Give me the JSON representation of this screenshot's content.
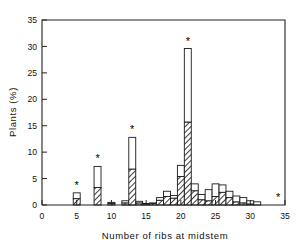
{
  "chart_data": {
    "type": "bar",
    "title": "",
    "subtitle": "",
    "xlabel": "Number of ribs at midstem",
    "ylabel": "Plants (%)",
    "xlim": [
      0,
      35
    ],
    "ylim": [
      0,
      35
    ],
    "xticks": [
      0,
      5,
      10,
      15,
      20,
      25,
      30,
      35
    ],
    "xticklabels": [
      "0",
      "5",
      "10",
      "15",
      "20",
      "25",
      "30",
      "35"
    ],
    "yticks": [
      0,
      5,
      10,
      15,
      20,
      25,
      30,
      35
    ],
    "yticklabels": [
      "0",
      "5",
      "10",
      "15",
      "20",
      "25",
      "30",
      "35"
    ],
    "grid": false,
    "legend": false,
    "legend_position": "none",
    "stacked": true,
    "bar_width": 1,
    "categories": [
      4,
      5,
      6,
      7,
      8,
      9,
      10,
      11,
      12,
      13,
      14,
      15,
      16,
      17,
      18,
      19,
      20,
      21,
      22,
      23,
      24,
      25,
      26,
      27,
      28,
      29,
      30,
      31,
      32,
      33,
      34
    ],
    "series": [
      {
        "name": "hatched-lower",
        "fill": "hatch",
        "values": [
          0.0,
          1.2,
          0.0,
          0.0,
          3.3,
          0.0,
          0.3,
          0.0,
          0.4,
          6.8,
          0.4,
          0.2,
          0.3,
          0.9,
          1.6,
          1.3,
          5.4,
          15.7,
          2.7,
          1.0,
          0.8,
          1.6,
          2.4,
          1.4,
          0.6,
          0.4,
          0.2,
          0.0,
          0.0,
          0.0,
          0.0
        ]
      },
      {
        "name": "open-upper",
        "fill": "white",
        "values": [
          0.0,
          1.1,
          0.0,
          0.0,
          4.0,
          0.0,
          0.2,
          0.0,
          0.4,
          6.0,
          0.3,
          0.1,
          0.1,
          0.5,
          1.0,
          0.5,
          2.1,
          13.9,
          1.3,
          1.0,
          2.1,
          2.4,
          1.4,
          1.2,
          1.1,
          1.0,
          0.6,
          0.6,
          0.0,
          0.0,
          0.0
        ]
      }
    ],
    "totals": [
      0.0,
      2.3,
      0.0,
      0.0,
      7.3,
      0.0,
      0.5,
      0.0,
      0.8,
      12.8,
      0.7,
      0.3,
      0.4,
      1.4,
      2.6,
      1.8,
      7.5,
      29.6,
      4.0,
      2.0,
      2.9,
      4.0,
      3.8,
      2.6,
      1.7,
      1.4,
      0.8,
      0.6,
      0.0,
      0.0,
      0.0
    ],
    "annotations": [
      {
        "label": "*",
        "x": 5,
        "y": 2.3
      },
      {
        "label": "*",
        "x": 8,
        "y": 7.3
      },
      {
        "label": "*",
        "x": 13,
        "y": 12.8
      },
      {
        "label": "*",
        "x": 21,
        "y": 29.6
      },
      {
        "label": "*",
        "x": 34,
        "y": 0.0
      }
    ],
    "colors": {
      "axis": "#222222",
      "outline": "#1a1a1a",
      "hatch": "#4a4a4a",
      "open": "#ffffff",
      "background": "#ffffff"
    }
  }
}
